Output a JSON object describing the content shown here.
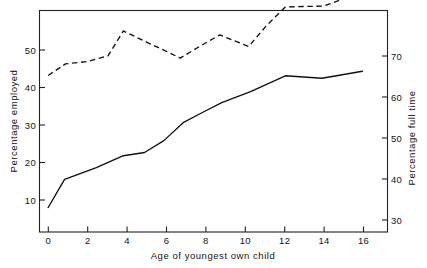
{
  "chart_data": {
    "type": "line",
    "title": "",
    "subtitle": "",
    "xlabel": "Age of youngest own child",
    "ylabel": "Percentage employed",
    "y2label": "Percentage full time",
    "xlim": [
      -0.45,
      17.6
    ],
    "ylim": [
      4.2,
      58.5
    ],
    "y2lim": [
      26.2,
      76.0
    ],
    "xticks": [
      0,
      2,
      4,
      6,
      8,
      10,
      12,
      14,
      16
    ],
    "xticklabels": [
      "0",
      "2",
      "4",
      "6",
      "8",
      "10",
      "12",
      "14",
      "16"
    ],
    "yticks": [
      10,
      20,
      30,
      40,
      50
    ],
    "yticklabels": [
      "10",
      "20",
      "30",
      "40",
      "50"
    ],
    "y2ticks": [
      30,
      40,
      50,
      60,
      70
    ],
    "y2ticklabels": [
      "30",
      "40",
      "50",
      "60",
      "70"
    ],
    "grid": false,
    "legend": "none",
    "frame": "box",
    "series": [
      {
        "name": "Percentage employed",
        "axis": "left",
        "style": "solid",
        "color": "#111111",
        "x": [
          0.0,
          0.85,
          2.5,
          3.9,
          5.0,
          6.0,
          7.0,
          8.0,
          9.0,
          10.5,
          12.3,
          14.2,
          16.3
        ],
        "values": [
          10.2,
          17.1,
          20.0,
          22.9,
          23.7,
          26.6,
          31.0,
          33.5,
          35.9,
          38.6,
          42.5,
          41.9,
          43.6
        ]
      },
      {
        "name": "Percentage full time",
        "axis": "right",
        "style": "dashed",
        "color": "#111111",
        "x": [
          0.0,
          0.9,
          2.0,
          3.1,
          3.9,
          5.1,
          6.0,
          6.85,
          8.0,
          8.9,
          10.4,
          11.3,
          12.3,
          14.3,
          16.3
        ],
        "values_left_scale": [
          40.1,
          42.0,
          42.4,
          43.3,
          47.4,
          45.6,
          44.3,
          43.0,
          45.2,
          46.8,
          44.9,
          48.2,
          51.4,
          51.5,
          53.8
        ],
        "values": [
          61.4,
          64.0,
          64.5,
          65.8,
          71.4,
          68.9,
          67.1,
          65.3,
          68.3,
          70.5,
          67.9,
          72.5,
          76.8,
          77.0,
          80.2
        ]
      }
    ]
  }
}
